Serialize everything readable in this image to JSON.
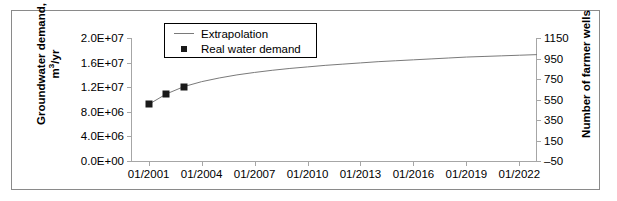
{
  "chart_data": {
    "type": "line",
    "title": "",
    "xlabel": "",
    "ylabel": "Groundwater demand, m3/yr",
    "y2label": "Number of farmer wells",
    "grid": false,
    "legend_position": "top-center",
    "xlim": [
      "01/2000",
      "01/2023"
    ],
    "xticklabels": [
      "01/2001",
      "01/2004",
      "01/2007",
      "01/2010",
      "01/2013",
      "01/2016",
      "01/2019",
      "01/2022"
    ],
    "ylim": [
      0,
      20000000
    ],
    "yticklabels": [
      "0.0E+00",
      "4.0E+06",
      "8.0E+06",
      "1.2E+07",
      "1.6E+07",
      "2.0E+07"
    ],
    "ytickvalues": [
      0,
      4000000,
      8000000,
      12000000,
      16000000,
      20000000
    ],
    "y2lim": [
      -50,
      1150
    ],
    "y2ticklabels": [
      "-50",
      "150",
      "350",
      "550",
      "750",
      "950",
      "1150"
    ],
    "y2tickvalues": [
      -50,
      150,
      350,
      550,
      750,
      950,
      1150
    ],
    "series": [
      {
        "name": "Extrapolation",
        "type": "line",
        "color": "#7a7a7a",
        "x": [
          "01/2001",
          "01/2002",
          "01/2003",
          "01/2004",
          "01/2005",
          "01/2006",
          "01/2007",
          "01/2008",
          "01/2009",
          "01/2010",
          "01/2011",
          "01/2012",
          "01/2013",
          "01/2014",
          "01/2015",
          "01/2016",
          "01/2017",
          "01/2018",
          "01/2019",
          "01/2020",
          "01/2021",
          "01/2022",
          "01/2023"
        ],
        "values": [
          9200000,
          10900000,
          12100000,
          12900000,
          13500000,
          14000000,
          14400000,
          14750000,
          15050000,
          15300000,
          15550000,
          15750000,
          15950000,
          16150000,
          16300000,
          16450000,
          16600000,
          16750000,
          16900000,
          17000000,
          17100000,
          17200000,
          17300000
        ]
      },
      {
        "name": "Real water demand",
        "type": "scatter",
        "color": "#1a1a1a",
        "marker": "square",
        "x": [
          "01/2001",
          "01/2002",
          "01/2003"
        ],
        "values": [
          9200000,
          10900000,
          12100000
        ]
      }
    ]
  },
  "legend": {
    "items": [
      {
        "label": "Extrapolation",
        "key": "line-key-icon"
      },
      {
        "label": "Real water demand",
        "key": "square-marker-icon"
      }
    ]
  },
  "axes": {
    "left_title_line1": "Groundwater demand,",
    "left_title_line2_base": "m",
    "left_title_line2_sup": "3",
    "left_title_line2_rest": "/yr",
    "right_title": "Number of farmer wells"
  }
}
